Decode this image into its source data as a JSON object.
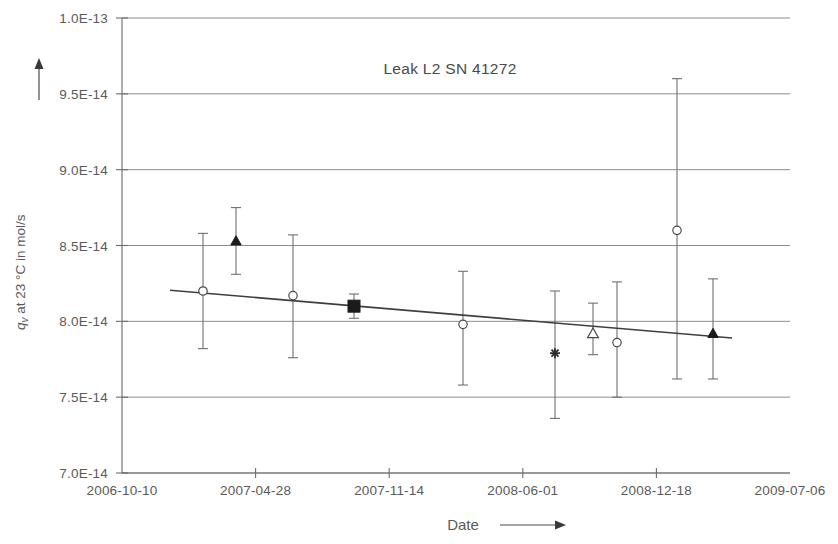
{
  "chart_data": {
    "type": "scatter",
    "title": "Leak L2 SN 41272",
    "xlabel": "Date",
    "ylabel": "q_v at 23 °C in mol/s",
    "ylabel_parts": {
      "q": "q",
      "sub": "v",
      "rest": " at 23 °C in mol/s"
    },
    "x_tick_labels": [
      "2006-10-10",
      "2007-04-28",
      "2007-11-14",
      "2008-06-01",
      "2008-12-18",
      "2009-07-06"
    ],
    "y_tick_labels": [
      "1.0E-13",
      "9.5E-14",
      "9.0E-14",
      "8.5E-14",
      "8.0E-14",
      "7.5E-14",
      "7.0E-14"
    ],
    "y_tick_values": [
      1e-13,
      9.5e-14,
      9e-14,
      8.5e-14,
      8e-14,
      7.5e-14,
      7e-14
    ],
    "ylim": [
      7e-14,
      1e-13
    ],
    "xlim": [
      "2006-10-10",
      "2009-07-06"
    ],
    "grid": true,
    "legend": "none",
    "y_axis_direction_arrow": true,
    "x_axis_direction_arrow": true,
    "points": [
      {
        "date": "2007-02-08",
        "x_px": 203,
        "value": 8.2e-14,
        "err_low": 7.82e-14,
        "err_high": 8.58e-14,
        "marker": "open-circle"
      },
      {
        "date": "2007-04-11",
        "x_px": 236,
        "value": 8.53e-14,
        "err_low": 8.31e-14,
        "err_high": 8.75e-14,
        "marker": "filled-triangle"
      },
      {
        "date": "2007-06-18",
        "x_px": 293,
        "value": 8.17e-14,
        "err_low": 7.76e-14,
        "err_high": 8.57e-14,
        "marker": "open-circle"
      },
      {
        "date": "2007-10-10",
        "x_px": 354,
        "value": 8.1e-14,
        "err_low": 8.02e-14,
        "err_high": 8.18e-14,
        "marker": "filled-square"
      },
      {
        "date": "2008-03-06",
        "x_px": 463,
        "value": 7.98e-14,
        "err_low": 7.58e-14,
        "err_high": 8.33e-14,
        "marker": "open-circle"
      },
      {
        "date": "2008-06-23",
        "x_px": 555,
        "value": 7.79e-14,
        "err_low": 7.36e-14,
        "err_high": 8.2e-14,
        "marker": "asterisk"
      },
      {
        "date": "2008-08-14",
        "x_px": 593,
        "value": 7.92e-14,
        "err_low": 7.78e-14,
        "err_high": 8.12e-14,
        "marker": "open-triangle"
      },
      {
        "date": "2008-09-15",
        "x_px": 617,
        "value": 7.86e-14,
        "err_low": 7.5e-14,
        "err_high": 8.26e-14,
        "marker": "open-circle"
      },
      {
        "date": "2008-12-26",
        "x_px": 677,
        "value": 8.6e-14,
        "err_low": 7.62e-14,
        "err_high": 9.6e-14,
        "marker": "open-circle"
      },
      {
        "date": "2009-02-24",
        "x_px": 713,
        "value": 7.92e-14,
        "err_low": 7.62e-14,
        "err_high": 8.28e-14,
        "marker": "filled-triangle"
      }
    ],
    "trendline": {
      "x_start_px": 170,
      "y_start_value": 8.205e-14,
      "x_end_px": 732,
      "y_end_value": 7.89e-14
    }
  }
}
